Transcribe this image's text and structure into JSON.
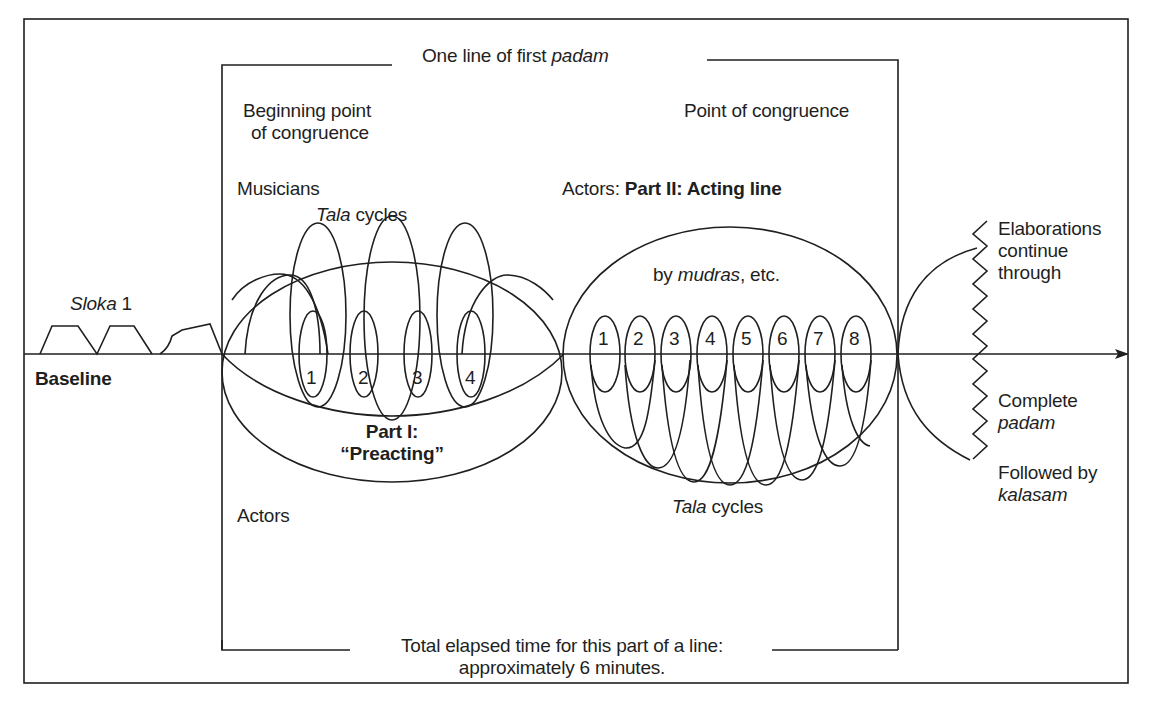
{
  "diagram": {
    "header": {
      "prefix": "One line of first ",
      "italic": "padam"
    },
    "labels": {
      "beginning_point_line1": "Beginning point",
      "beginning_point_line2": "of congruence",
      "point_of_congruence": "Point of congruence",
      "musicians": "Musicians",
      "tala_cycles_top_italic": "Tala",
      "tala_cycles_top_rest": " cycles",
      "actors_prefix": "Actors: ",
      "acting_line_bold": "Part II: Acting line",
      "by": "by ",
      "mudras_italic": "mudras",
      "etc": ", etc.",
      "sloka_italic": "Sloka",
      "sloka_num": " 1",
      "baseline": "Baseline",
      "part1_line1": "Part I:",
      "part1_line2": "“Preacting”",
      "actors": "Actors",
      "tala_cycles_bottom_italic": "Tala",
      "tala_cycles_bottom_rest": " cycles",
      "elaborations_line1": "Elaborations",
      "elaborations_line2": "continue",
      "elaborations_line3": "through",
      "complete": "Complete",
      "padam_italic": "padam",
      "followed_by": "Followed by",
      "kalasam_italic": "kalasam",
      "total_line1": "Total elapsed time for this part of a line:",
      "total_line2": "approximately 6 minutes."
    },
    "part1_cycles": [
      "1",
      "2",
      "3",
      "4"
    ],
    "part2_cycles": [
      "1",
      "2",
      "3",
      "4",
      "5",
      "6",
      "7",
      "8"
    ],
    "colors": {
      "stroke": "#1f1f1f",
      "background": "#ffffff"
    }
  }
}
